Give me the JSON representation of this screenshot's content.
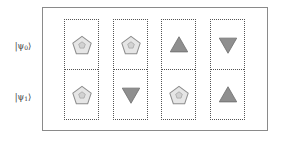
{
  "figure": {
    "name": "quantum-state-shape-grid",
    "rows": [
      {
        "id": "row-0",
        "label_prefix": "|ψ",
        "label_sub": "0",
        "label_suffix": "⟩",
        "label_full": "|ψ₀⟩"
      },
      {
        "id": "row-1",
        "label_prefix": "|ψ",
        "label_sub": "1",
        "label_suffix": "⟩",
        "label_full": "|ψ₁⟩"
      }
    ],
    "columns": [
      {
        "id": "column-1",
        "cells": [
          {
            "row": "row-0",
            "shape": "pentagon-icon",
            "shape_name": "pentagon",
            "fill": "#e6e6e6",
            "stroke": "#8c8c8c",
            "marked": true
          },
          {
            "row": "row-1",
            "shape": "pentagon-icon",
            "shape_name": "pentagon",
            "fill": "#e6e6e6",
            "stroke": "#8c8c8c",
            "marked": true
          }
        ]
      },
      {
        "id": "column-2",
        "cells": [
          {
            "row": "row-0",
            "shape": "pentagon-icon",
            "shape_name": "pentagon",
            "fill": "#e6e6e6",
            "stroke": "#8c8c8c",
            "marked": true
          },
          {
            "row": "row-1",
            "shape": "triangle-down-icon",
            "shape_name": "triangle-down",
            "fill": "#8f8f8f",
            "stroke": "#6e6e6e",
            "marked": false
          }
        ]
      },
      {
        "id": "column-3",
        "cells": [
          {
            "row": "row-0",
            "shape": "triangle-up-icon",
            "shape_name": "triangle-up",
            "fill": "#8f8f8f",
            "stroke": "#6e6e6e",
            "marked": false
          },
          {
            "row": "row-1",
            "shape": "pentagon-icon",
            "shape_name": "pentagon",
            "fill": "#e6e6e6",
            "stroke": "#8c8c8c",
            "marked": true
          }
        ]
      },
      {
        "id": "column-4",
        "cells": [
          {
            "row": "row-0",
            "shape": "triangle-down-icon",
            "shape_name": "triangle-down",
            "fill": "#8f8f8f",
            "stroke": "#6e6e6e",
            "marked": false
          },
          {
            "row": "row-1",
            "shape": "triangle-up-icon",
            "shape_name": "triangle-up",
            "fill": "#8f8f8f",
            "stroke": "#6e6e6e",
            "marked": false
          }
        ]
      }
    ],
    "colors": {
      "outer_frame": "#8a8a8a",
      "cell_border": "#555555",
      "background": "#ffffff",
      "pentagon_fill": "#e6e6e6",
      "pentagon_stroke": "#8c8c8c",
      "triangle_fill": "#8f8f8f",
      "triangle_stroke": "#6e6e6e",
      "label_text": "#3a3a3a"
    }
  }
}
